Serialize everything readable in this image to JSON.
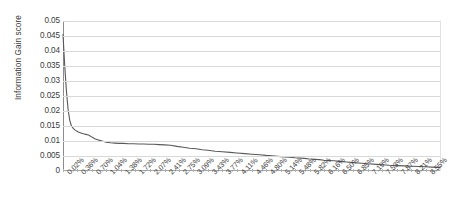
{
  "chart_data": {
    "type": "line",
    "title": "",
    "xlabel": "",
    "ylabel": "Information Gain score",
    "ylim": [
      0,
      0.05
    ],
    "ytick_labels": [
      "0.05",
      "0.045",
      "0.04",
      "0.035",
      "0.03",
      "0.025",
      "0.02",
      "0.015",
      "0.01",
      "0.005",
      "0"
    ],
    "ytick_values": [
      0.05,
      0.045,
      0.04,
      0.035,
      0.03,
      0.025,
      0.02,
      0.015,
      0.01,
      0.005,
      0
    ],
    "grid": true,
    "legend": "none",
    "line_color": "#595959",
    "xtick_labels": [
      "0.02%",
      "0.36%",
      "0.70%",
      "1.04%",
      "1.38%",
      "1.72%",
      "2.07%",
      "2.41%",
      "2.75%",
      "3.09%",
      "3.43%",
      "3.77%",
      "4.11%",
      "4.46%",
      "4.80%",
      "5.14%",
      "5.48%",
      "5.82%",
      "6.16%",
      "6.50%",
      "6.85%",
      "7.19%",
      "7.53%",
      "7.87%",
      "8.21%",
      "8.55%"
    ],
    "xtick_values": [
      0.02,
      0.36,
      0.7,
      1.04,
      1.38,
      1.72,
      2.07,
      2.41,
      2.75,
      3.09,
      3.43,
      3.77,
      4.11,
      4.46,
      4.8,
      5.14,
      5.48,
      5.82,
      6.16,
      6.5,
      6.85,
      7.19,
      7.53,
      7.87,
      8.21,
      8.55
    ],
    "xlim": [
      0.02,
      8.89
    ],
    "x": [
      0.02,
      0.06,
      0.1,
      0.14,
      0.18,
      0.22,
      0.26,
      0.3,
      0.34,
      0.38,
      0.44,
      0.5,
      0.56,
      0.62,
      0.7,
      0.78,
      0.86,
      0.94,
      1.04,
      1.14,
      1.24,
      1.34,
      1.44,
      1.56,
      1.68,
      1.8,
      1.92,
      2.04,
      2.16,
      2.28,
      2.41,
      2.55,
      2.7,
      2.85,
      3.0,
      3.15,
      3.3,
      3.43,
      3.6,
      3.77,
      3.95,
      4.11,
      4.3,
      4.46,
      4.65,
      4.8,
      5.0,
      5.14,
      5.35,
      5.48,
      5.7,
      5.82,
      6.05,
      6.16,
      6.4,
      6.5,
      6.7,
      6.85,
      7.05,
      7.19,
      7.4,
      7.53,
      7.7,
      7.87,
      8.05,
      8.21,
      8.4,
      8.55,
      8.7,
      8.89
    ],
    "values": [
      0.0455,
      0.0352,
      0.0268,
      0.0205,
      0.0168,
      0.015,
      0.0142,
      0.0137,
      0.0133,
      0.013,
      0.0127,
      0.0124,
      0.0122,
      0.012,
      0.0113,
      0.0107,
      0.0103,
      0.01,
      0.0096,
      0.0094,
      0.0093,
      0.0092,
      0.0092,
      0.0091,
      0.0091,
      0.009,
      0.009,
      0.0089,
      0.0089,
      0.0088,
      0.0087,
      0.0086,
      0.0082,
      0.0079,
      0.0076,
      0.0074,
      0.0071,
      0.0069,
      0.0066,
      0.0064,
      0.0062,
      0.006,
      0.0058,
      0.0056,
      0.0054,
      0.0052,
      0.005,
      0.0048,
      0.0046,
      0.0044,
      0.0042,
      0.004,
      0.0038,
      0.0036,
      0.0034,
      0.0032,
      0.003,
      0.0028,
      0.0026,
      0.0024,
      0.0022,
      0.0021,
      0.0019,
      0.0018,
      0.0017,
      0.0016,
      0.0015,
      0.0014,
      0.0013,
      0.0012
    ]
  }
}
